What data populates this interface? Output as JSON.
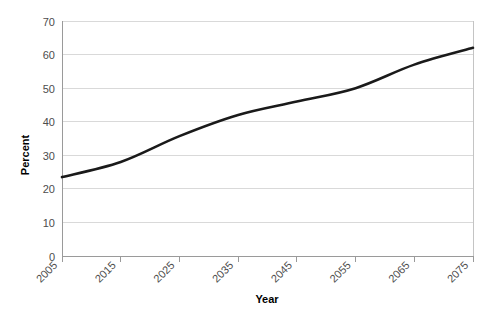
{
  "chart_data": {
    "type": "line",
    "title": "",
    "subtitle": "",
    "xlabel": "Year",
    "ylabel": "Percent",
    "x": [
      2005,
      2015,
      2025,
      2035,
      2045,
      2055,
      2065,
      2075
    ],
    "categories": [
      "2005",
      "2015",
      "2025",
      "2035",
      "2045",
      "2055",
      "2065",
      "2075"
    ],
    "series": [
      {
        "name": "Percent",
        "color": "#1a1a1a",
        "values": [
          23.5,
          28.0,
          35.7,
          42.0,
          46.0,
          50.0,
          57.0,
          62.0
        ]
      }
    ],
    "ylim": [
      0,
      70
    ],
    "yticks": [
      0,
      10,
      20,
      30,
      40,
      50,
      60,
      70
    ],
    "ytick_labels": [
      "0",
      "10",
      "20",
      "30",
      "40",
      "50",
      "60",
      "70"
    ],
    "xlim": [
      2005,
      2075
    ],
    "xticks": [
      2005,
      2015,
      2025,
      2035,
      2045,
      2055,
      2065,
      2075
    ],
    "xtick_labels": [
      "2005",
      "2015",
      "2025",
      "2035",
      "2045",
      "2055",
      "2065",
      "2075"
    ],
    "xtick_rotation": -45,
    "grid": {
      "horizontal": true,
      "vertical": false,
      "color": "#d9d9d9"
    },
    "legend": {
      "visible": false,
      "position": "none"
    },
    "background_color": "#ffffff",
    "plot_area": {
      "left": 62,
      "right": 473,
      "top": 21,
      "bottom": 256
    }
  }
}
